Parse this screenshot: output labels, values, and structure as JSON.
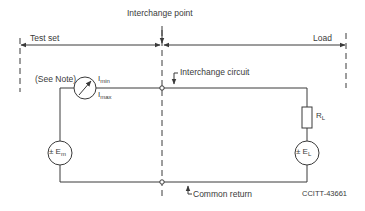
{
  "diagram": {
    "title": "Interchange point",
    "regions": {
      "left_label": "Test set",
      "right_label": "Load"
    },
    "annotations": {
      "interchange_circuit": "Interchange circuit",
      "common_return": "Common return",
      "see_note": "(See Note)",
      "figure_id": "CCITT-43661"
    },
    "components": {
      "meter": {
        "icon": "ammeter-icon",
        "label_min_main": "I",
        "label_min_sub": "min",
        "label_max_main": "I",
        "label_max_sub": "max"
      },
      "source_m": {
        "icon": "voltage-source-icon",
        "prefix": "± E",
        "sub": "m"
      },
      "source_l": {
        "icon": "voltage-source-icon",
        "prefix": "± E",
        "sub": "L"
      },
      "resistor": {
        "icon": "resistor-icon",
        "main": "R",
        "sub": "L"
      }
    },
    "colors": {
      "line": "#3a3a3a",
      "background": "#ffffff"
    }
  }
}
